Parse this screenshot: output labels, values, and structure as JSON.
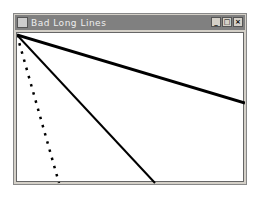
{
  "window": {
    "title": "Bad Long Lines",
    "buttons": {
      "minimize": "_",
      "maximize": "□",
      "close": "×"
    }
  },
  "canvas": {
    "lines": [
      {
        "x1": 0,
        "y1": 2,
        "x2": 228,
        "y2": 70,
        "style": "thick-stepped"
      },
      {
        "x1": 0,
        "y1": 2,
        "x2": 138,
        "y2": 150,
        "style": "thin"
      },
      {
        "x1": 0,
        "y1": 2,
        "x2": 42,
        "y2": 150,
        "style": "dotted"
      }
    ],
    "color": "#000000"
  }
}
